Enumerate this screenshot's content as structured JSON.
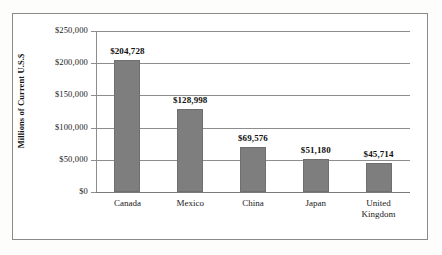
{
  "chart_data": {
    "type": "bar",
    "title": "",
    "subtitle": "",
    "xlabel": "",
    "ylabel": "Millions of Current U.S.$",
    "categories": [
      "Canada",
      "Mexico",
      "China",
      "Japan",
      "United\nKingdom"
    ],
    "values": [
      204728,
      128998,
      69576,
      51180,
      45714
    ],
    "value_labels": [
      "$204,728",
      "$128,998",
      "$69,576",
      "$51,180",
      "$45,714"
    ],
    "ylim": [
      0,
      250000
    ],
    "ytick_values": [
      0,
      50000,
      100000,
      150000,
      200000,
      250000
    ],
    "ytick_labels": [
      "$0",
      "$50,000",
      "$100,000",
      "$150,000",
      "$200,000",
      "$250,000"
    ],
    "grid": true,
    "legend": false,
    "orientation": "vertical",
    "bar_color": "#7e7e7e",
    "gridline_color": "#8d8d8d",
    "background_color": "#ffffff",
    "text_color": "#1a1a1a"
  }
}
